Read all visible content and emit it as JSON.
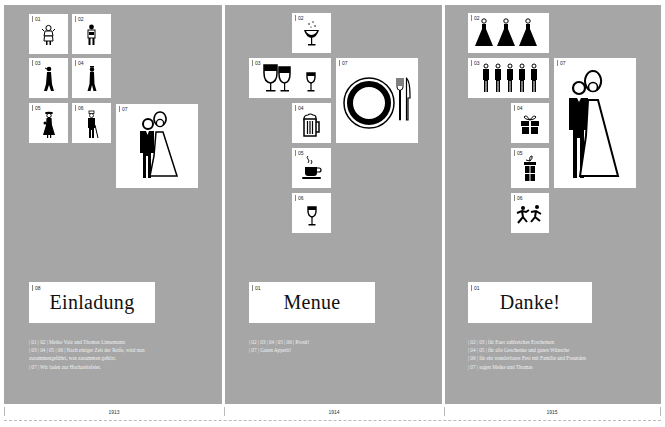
{
  "panels": [
    {
      "year": "1913",
      "title_num": "08",
      "title": "Einladung",
      "boxes": {
        "b01": {
          "num": "01",
          "icon": "girl-figure-icon"
        },
        "b02": {
          "num": "02",
          "icon": "boy-figure-icon"
        },
        "b03": {
          "num": "03",
          "icon": "young-woman-figure-icon"
        },
        "b04": {
          "num": "04",
          "icon": "young-man-figure-icon"
        },
        "b05": {
          "num": "05",
          "icon": "woman-with-hat-figure-icon"
        },
        "b06": {
          "num": "06",
          "icon": "man-with-cane-figure-icon"
        },
        "b07": {
          "num": "07",
          "icon": "bride-and-groom-icon"
        }
      },
      "description": [
        "| 01 | 02 | Meike Volz und Thomas Linnemann",
        "| 03 | 04 | 05 | 06 | Nach einiger Zeit der Reife, wird nun",
        "zusammengeführt, was zusammen gehört.",
        "| 07 | Wir laden zur Hochzeitsfeier."
      ]
    },
    {
      "year": "1914",
      "title_num": "01",
      "title": "Menue",
      "boxes": {
        "b02": {
          "num": "02",
          "icon": "champagne-glass-icon"
        },
        "b03": {
          "num": "03",
          "icon": "wine-glasses-icon"
        },
        "b04": {
          "num": "04",
          "icon": "beer-mug-icon"
        },
        "b05": {
          "num": "05",
          "icon": "coffee-cup-icon"
        },
        "b06": {
          "num": "06",
          "icon": "wine-glass-icon"
        },
        "b07": {
          "num": "07",
          "icon": "plate-fork-knife-icon"
        }
      },
      "description": [
        "| 02 | 03 | 04 | 05 | 06 | Prosit!",
        "| 07 | Guten Appetit!"
      ]
    },
    {
      "year": "1915",
      "title_num": "01",
      "title": "Danke!",
      "boxes": {
        "b02": {
          "num": "02",
          "icon": "bridesmaids-icon"
        },
        "b03": {
          "num": "03",
          "icon": "groomsmen-icon"
        },
        "b04": {
          "num": "04",
          "icon": "wide-gift-icon"
        },
        "b05": {
          "num": "05",
          "icon": "tall-gift-icon"
        },
        "b06": {
          "num": "06",
          "icon": "dancing-couple-icon"
        },
        "b07": {
          "num": "07",
          "icon": "bride-and-groom-icon"
        }
      },
      "description": [
        "| 02 | 03 | für Euer zahlreiches Erscheinen",
        "| 04 | 05 | für alle Geschenke und guten Wünsche",
        "| 06 | für ein wunderbares Fest mit Familie und Freunden",
        "| 07 | sagen Meike und Thomas"
      ]
    }
  ],
  "colors": {
    "panel_bg": "#a6a6a6",
    "box_bg": "#ffffff",
    "icon": "#000000",
    "desc_text": "#f2f2f2"
  }
}
